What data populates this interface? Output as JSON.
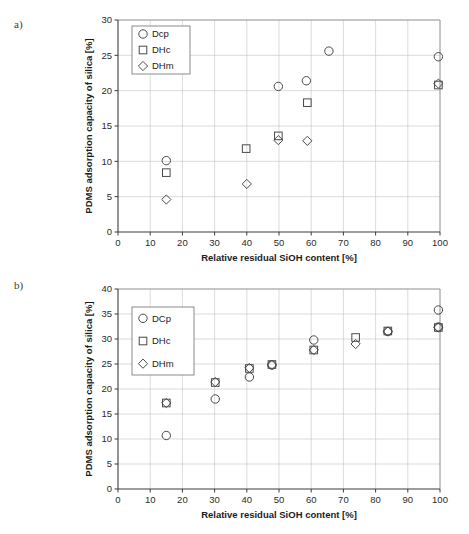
{
  "figure": {
    "panels": [
      {
        "id": "a",
        "label": "a)",
        "legend_position": "top-left"
      },
      {
        "id": "b",
        "label": "b)",
        "legend_position": "top-left"
      }
    ]
  },
  "chart_data": [
    {
      "type": "scatter",
      "title": "",
      "panel_label": "a)",
      "xlabel": "Relative residual SiOH content [%]",
      "ylabel": "PDMS adsorption capacity of silica [%]",
      "xlim": [
        0,
        100
      ],
      "ylim": [
        0,
        30
      ],
      "xticks": [
        0,
        10,
        20,
        30,
        40,
        50,
        60,
        70,
        80,
        90,
        100
      ],
      "yticks": [
        0,
        5,
        10,
        15,
        20,
        25,
        30
      ],
      "grid": true,
      "legend_position": "top-left",
      "series": [
        {
          "name": "Dcp",
          "marker": "circle",
          "points": [
            {
              "x": 15.0,
              "y": 10.1
            },
            {
              "x": 49.8,
              "y": 20.6
            },
            {
              "x": 58.5,
              "y": 21.4
            },
            {
              "x": 65.5,
              "y": 25.6
            },
            {
              "x": 99.5,
              "y": 24.8
            }
          ]
        },
        {
          "name": "DHc",
          "marker": "square",
          "points": [
            {
              "x": 15.0,
              "y": 8.4
            },
            {
              "x": 39.8,
              "y": 11.8
            },
            {
              "x": 49.8,
              "y": 13.6
            },
            {
              "x": 58.8,
              "y": 18.3
            },
            {
              "x": 99.5,
              "y": 20.8
            }
          ]
        },
        {
          "name": "DHm",
          "marker": "diamond",
          "points": [
            {
              "x": 15.0,
              "y": 4.6
            },
            {
              "x": 40.0,
              "y": 6.8
            },
            {
              "x": 49.8,
              "y": 13.0
            },
            {
              "x": 58.8,
              "y": 12.9
            },
            {
              "x": 99.5,
              "y": 21.0
            }
          ]
        }
      ]
    },
    {
      "type": "scatter",
      "title": "",
      "panel_label": "b)",
      "xlabel": "Relative residual SiOH content [%]",
      "ylabel": "PDMS adsorption capacity of silica [%]",
      "xlim": [
        0,
        100
      ],
      "ylim": [
        0,
        40
      ],
      "xticks": [
        0,
        10,
        20,
        30,
        40,
        50,
        60,
        70,
        80,
        90,
        100
      ],
      "yticks": [
        0,
        5,
        10,
        15,
        20,
        25,
        30,
        35,
        40
      ],
      "grid": true,
      "legend_position": "top-left",
      "series": [
        {
          "name": "DCp",
          "marker": "circle",
          "points": [
            {
              "x": 15.0,
              "y": 10.7
            },
            {
              "x": 30.2,
              "y": 18.0
            },
            {
              "x": 40.8,
              "y": 22.4
            },
            {
              "x": 47.8,
              "y": 24.8
            },
            {
              "x": 60.8,
              "y": 29.8
            },
            {
              "x": 83.8,
              "y": 31.5
            },
            {
              "x": 99.5,
              "y": 35.8
            },
            {
              "x": 99.5,
              "y": 32.4
            }
          ]
        },
        {
          "name": "DHc",
          "marker": "square",
          "points": [
            {
              "x": 15.0,
              "y": 17.2
            },
            {
              "x": 30.2,
              "y": 21.3
            },
            {
              "x": 40.8,
              "y": 24.1
            },
            {
              "x": 47.8,
              "y": 24.9
            },
            {
              "x": 60.8,
              "y": 27.8
            },
            {
              "x": 73.8,
              "y": 30.3
            },
            {
              "x": 83.8,
              "y": 31.6
            },
            {
              "x": 99.5,
              "y": 32.3
            }
          ]
        },
        {
          "name": "DHm",
          "marker": "diamond",
          "points": [
            {
              "x": 15.0,
              "y": 17.2
            },
            {
              "x": 30.2,
              "y": 21.4
            },
            {
              "x": 40.8,
              "y": 24.2
            },
            {
              "x": 47.8,
              "y": 24.8
            },
            {
              "x": 60.8,
              "y": 27.8
            },
            {
              "x": 73.8,
              "y": 29.0
            },
            {
              "x": 83.8,
              "y": 31.5
            },
            {
              "x": 99.5,
              "y": 32.3
            }
          ]
        }
      ]
    }
  ]
}
